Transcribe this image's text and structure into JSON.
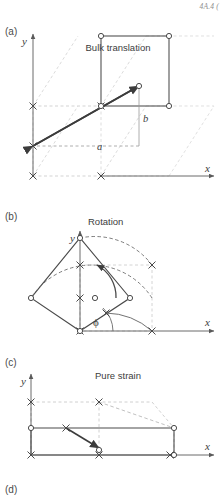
{
  "page": {
    "running_head": "4A.4 (",
    "width": 223,
    "height": 497
  },
  "style": {
    "ink": "#3c3c3c",
    "ghost": "#b9b9b9",
    "ghost_light": "#c8c8c8",
    "marker_original": "x-marker",
    "marker_displaced": "circle-marker"
  },
  "panels": [
    {
      "id": "a",
      "label": "(a)",
      "title": "Bulk translation",
      "axis_x_label": "x",
      "axis_y_label": "y",
      "vector_labels": {
        "horizontal": "a",
        "vertical": "b"
      }
    },
    {
      "id": "b",
      "label": "(b)",
      "title": "Rotation",
      "axis_x_label": "x",
      "axis_y_label": "y",
      "angle_label": "ϕ"
    },
    {
      "id": "c",
      "label": "(c)",
      "title": "Pure strain",
      "axis_x_label": "x",
      "axis_y_label": "y"
    },
    {
      "id": "d",
      "label": "(d)",
      "title": ""
    }
  ]
}
